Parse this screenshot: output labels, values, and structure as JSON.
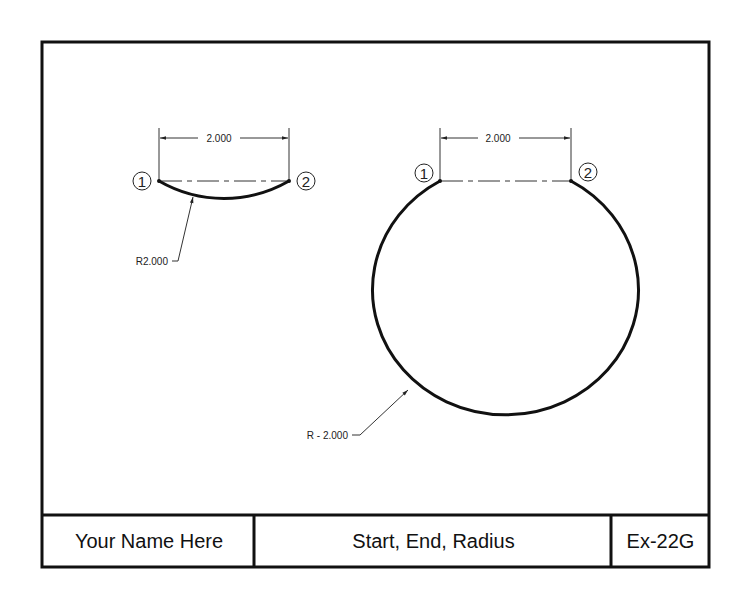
{
  "drawing": {
    "left_example": {
      "dimension_label": "2.000",
      "point_1_label": "1",
      "point_2_label": "2",
      "radius_label": "R2.000"
    },
    "right_example": {
      "dimension_label": "2.000",
      "point_1_label": "1",
      "point_2_label": "2",
      "radius_label": "R - 2.000"
    }
  },
  "title_block": {
    "name": "Your Name Here",
    "title": "Start, End, Radius",
    "exercise": "Ex-22G"
  },
  "colors": {
    "line": "#111111",
    "background": "#ffffff"
  }
}
